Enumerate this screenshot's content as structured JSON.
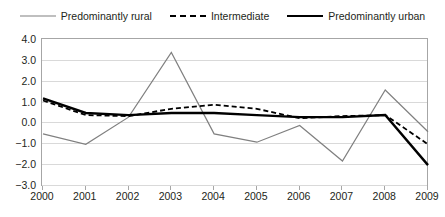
{
  "legend": {
    "position": "top-center",
    "entries": [
      {
        "label": "Predominantly rural",
        "style": "solid-thin",
        "color": "#808080",
        "icon": "line-swatch-icon"
      },
      {
        "label": "Intermediate",
        "style": "dashed",
        "color": "#000000",
        "icon": "dashed-line-swatch-icon"
      },
      {
        "label": "Predominantly urban",
        "style": "solid-thick",
        "color": "#000000",
        "icon": "thick-line-swatch-icon"
      }
    ]
  },
  "axes": {
    "y_ticks": [
      "4.0",
      "3.0",
      "2.0",
      "1.0",
      "0.0",
      "-1.0",
      "-2.0",
      "-3.0"
    ],
    "x_ticks": [
      "2000",
      "2001",
      "2002",
      "2003",
      "2004",
      "2005",
      "2006",
      "2007",
      "2008",
      "2009"
    ]
  },
  "chart_data": {
    "type": "line",
    "title": "",
    "subtitle": "",
    "xlabel": "",
    "ylabel": "",
    "x": [
      "2000",
      "2001",
      "2002",
      "2003",
      "2004",
      "2005",
      "2006",
      "2007",
      "2008",
      "2009"
    ],
    "ylim": [
      -3.0,
      4.0
    ],
    "xlim": [
      "2000",
      "2009"
    ],
    "ytick_step": 1.0,
    "grid": true,
    "legend_position": "top",
    "series": [
      {
        "name": "Predominantly rural",
        "color": "#808080",
        "style": "solid",
        "width": 1.2,
        "values": [
          -0.5,
          -1.0,
          0.3,
          3.4,
          -0.5,
          -0.9,
          -0.1,
          -1.8,
          1.6,
          -0.4
        ]
      },
      {
        "name": "Intermediate",
        "color": "#000000",
        "style": "dashed",
        "width": 1.8,
        "values": [
          1.1,
          0.4,
          0.35,
          0.7,
          0.9,
          0.7,
          0.25,
          0.35,
          0.4,
          -1.0
        ]
      },
      {
        "name": "Predominantly urban",
        "color": "#000000",
        "style": "solid",
        "width": 2.4,
        "values": [
          1.2,
          0.5,
          0.4,
          0.5,
          0.5,
          0.4,
          0.3,
          0.3,
          0.4,
          -2.0
        ]
      }
    ]
  }
}
